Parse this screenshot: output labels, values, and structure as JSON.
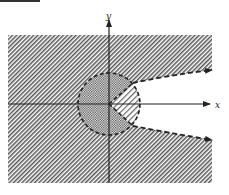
{
  "figure": {
    "axes": {
      "x_label": "x",
      "y_label": "y"
    },
    "regions": [
      {
        "name": "outer-region",
        "fill": "diagonal-hatch"
      },
      {
        "name": "disk-region",
        "fill": "cross-hatch",
        "boundary": "dashed-circle"
      },
      {
        "name": "parabola-interior-wedge",
        "fill": "light-diagonal-hatch"
      }
    ],
    "curves": [
      {
        "name": "parabola-upper-branch",
        "style": "dashed",
        "arrow": "right"
      },
      {
        "name": "parabola-lower-branch",
        "style": "dashed",
        "arrow": "right"
      }
    ],
    "colors": {
      "ink": "#222222",
      "background": "#ffffff"
    }
  }
}
